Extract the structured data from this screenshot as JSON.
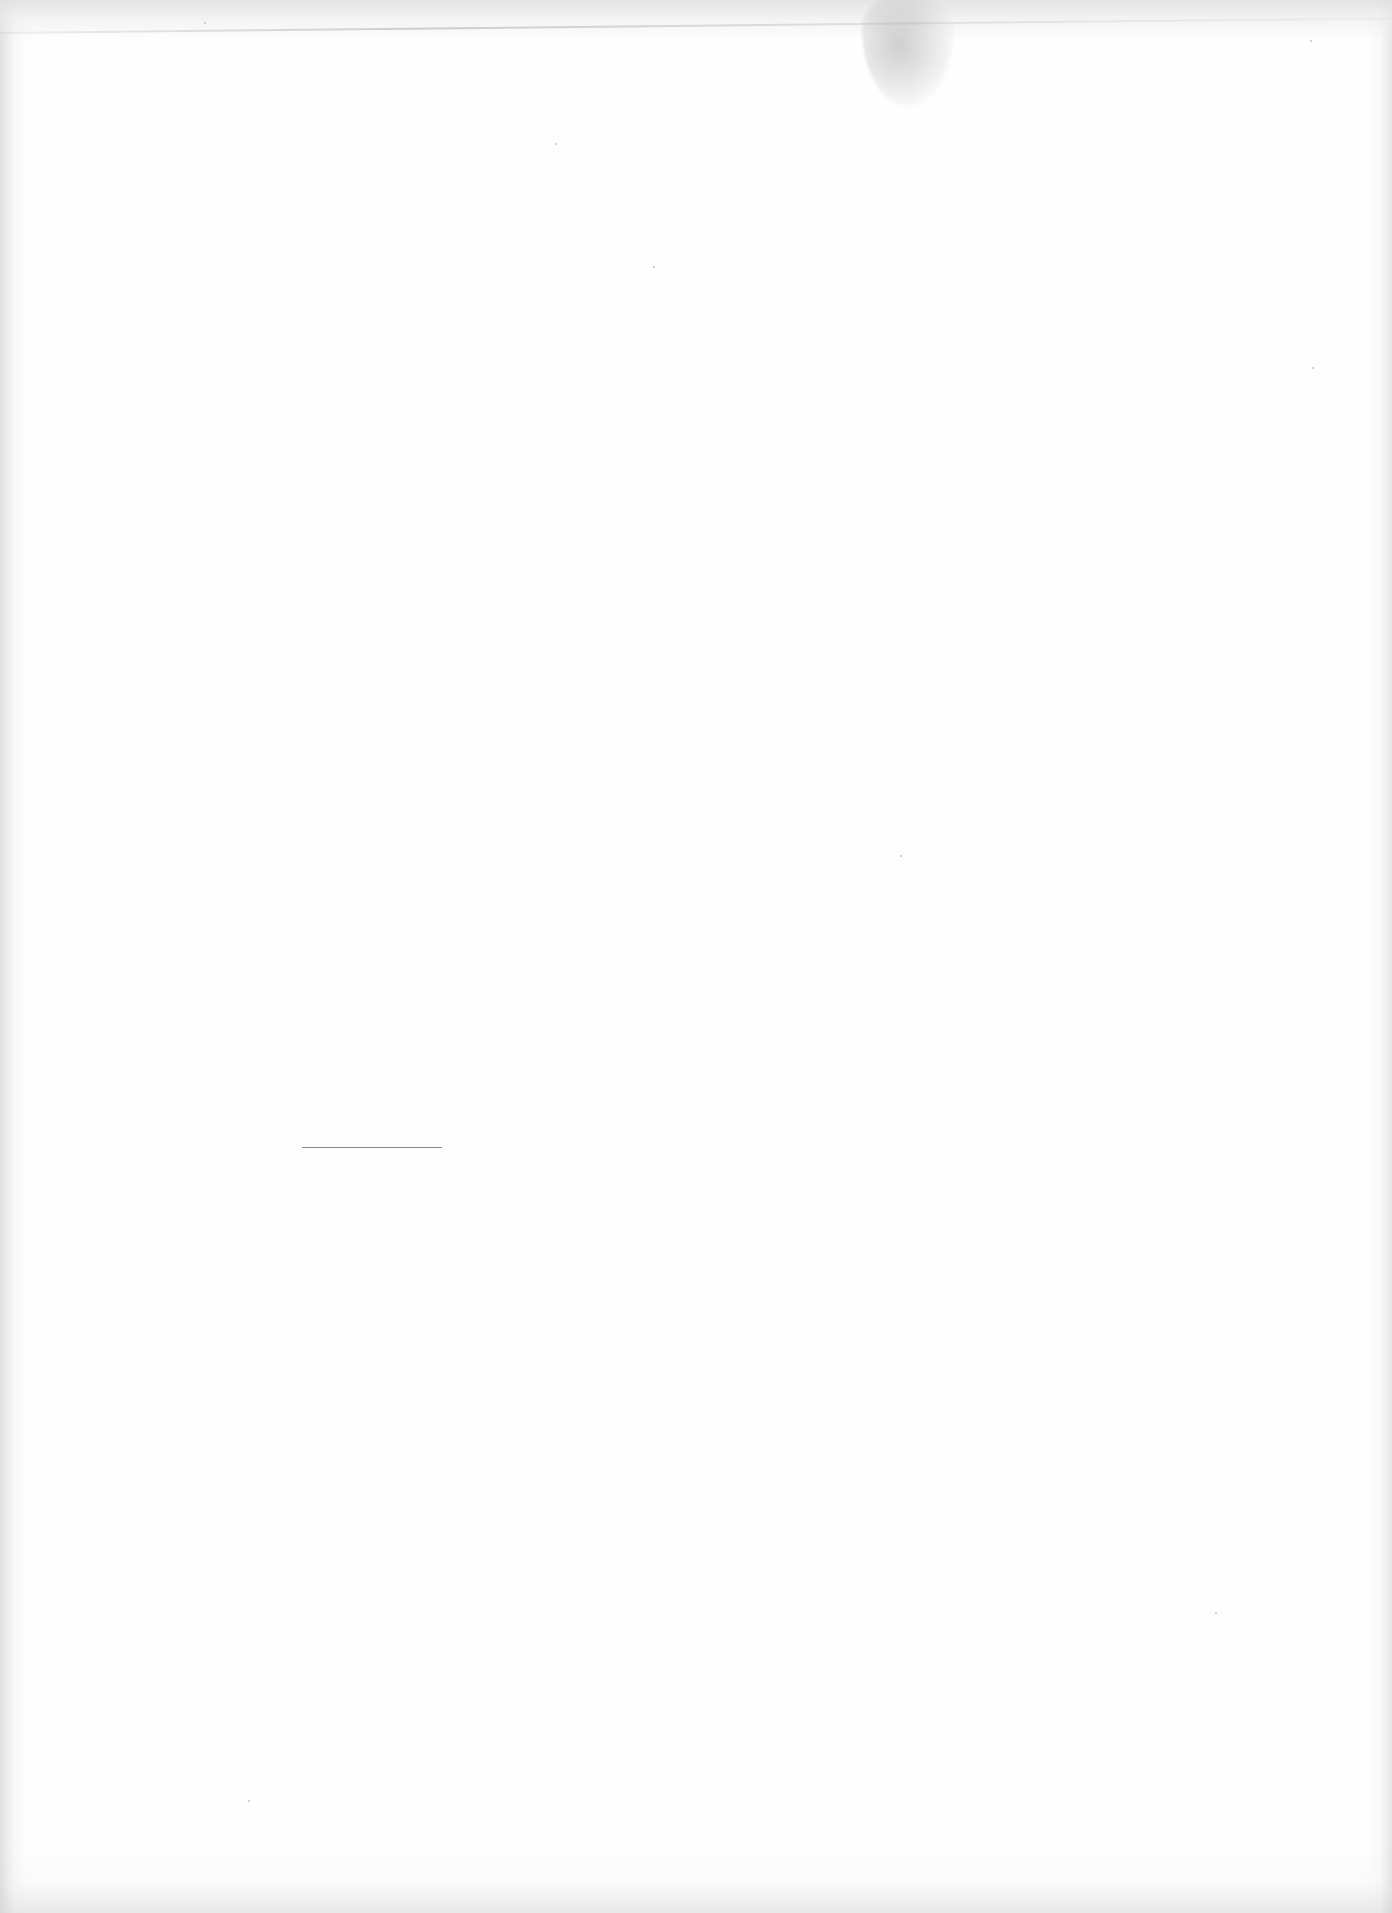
{
  "document": {
    "type": "blank scanned page",
    "text_content": "",
    "background_color": "#fefefe"
  },
  "footnote_rule": {
    "x": 302,
    "y": 1147,
    "width": 140,
    "color": "#8a8a8a"
  },
  "artifacts": {
    "smudge": {
      "x": 862,
      "y": 0,
      "width": 92,
      "height": 110
    },
    "top_crease_y": 32
  }
}
